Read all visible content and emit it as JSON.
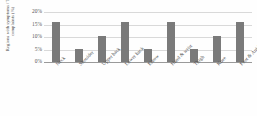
{
  "chart_data": {
    "type": "bar",
    "title": "",
    "subtitle": "",
    "xlabel": "",
    "ylabel": "Regions with symptoms / Total complaints (%)",
    "categories": [
      "Neck",
      "Shoulder",
      "Upper back",
      "Lower back",
      "Elbow",
      "Hand & wrist",
      "Thigh",
      "Knee",
      "Foot & Ankle"
    ],
    "values": [
      16,
      5.3,
      10.5,
      16,
      5.3,
      16,
      5.3,
      10.5,
      16
    ],
    "series": [
      {
        "name": "Regions with symptoms / Total complaints (%)",
        "values": [
          16,
          5.3,
          10.5,
          16,
          5.3,
          16,
          5.3,
          10.5,
          16
        ]
      }
    ],
    "ylim": [
      0,
      20
    ],
    "ytick_labels": [
      "0%",
      "5%",
      "10%",
      "15%",
      "20%"
    ],
    "ytick_values": [
      0,
      5,
      10,
      15,
      20
    ],
    "grid": true,
    "legend": false,
    "legend_position": "none",
    "bar_color": "#7a7a7a",
    "gridline_color": "#d9d9d9",
    "axis_color": "#9a9a9a",
    "background_color": "#ffffff"
  }
}
